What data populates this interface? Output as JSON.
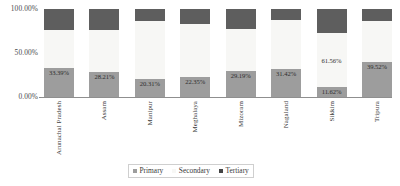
{
  "chart_data": {
    "type": "bar",
    "stacked": true,
    "normalized_percent": true,
    "title": "",
    "subtitle": "",
    "xlabel": "",
    "ylabel": "",
    "ylim": [
      0,
      100
    ],
    "ytick_labels": [
      "0.00%",
      "50.00%",
      "100.00%"
    ],
    "ytick_values": [
      0,
      50,
      100
    ],
    "grid": false,
    "legend_position": "bottom-center",
    "categories": [
      "Arunachal Pradesh",
      "Assam",
      "Manipur",
      "Meghalaya",
      "Mizoram",
      "Nagaland",
      "Sikkim",
      "Tripura"
    ],
    "series": [
      {
        "name": "Primary",
        "color": "#9d9d9d",
        "values": [
          33.39,
          28.21,
          20.31,
          22.35,
          29.19,
          31.42,
          11.62,
          39.52
        ],
        "labels": [
          "33.39%",
          "28.21%",
          "20.31%",
          "22.35%",
          "29.19%",
          "31.42%",
          "11.62%",
          "39.52%"
        ],
        "labels_visible": [
          true,
          true,
          true,
          true,
          true,
          true,
          true,
          true
        ]
      },
      {
        "name": "Secondary",
        "color": "#f7f7f5",
        "values": [
          43.23,
          48.05,
          66.42,
          60.54,
          47.6,
          56.4,
          61.56,
          46.93
        ],
        "labels": [
          "43.23%",
          "48.05%",
          "66.42%",
          "60.54%",
          "47.60%",
          "56.40%",
          "61.56%",
          "46.93%"
        ],
        "labels_visible": [
          false,
          false,
          false,
          false,
          false,
          false,
          true,
          false
        ]
      },
      {
        "name": "Tertiary",
        "color": "#5e5e5e",
        "values": [
          23.38,
          23.74,
          13.27,
          17.11,
          23.21,
          12.18,
          26.82,
          13.55
        ],
        "labels": [
          "23.38%",
          "23.74%",
          "13.27%",
          "17.11%",
          "23.21%",
          "12.18%",
          "26.82%",
          "13.55%"
        ],
        "labels_visible": [
          true,
          true,
          true,
          true,
          true,
          true,
          false,
          true
        ]
      }
    ]
  },
  "axes": {
    "y_ticks": [
      {
        "label": "100.00%"
      },
      {
        "label": "50.00%"
      },
      {
        "label": "0.00%"
      }
    ]
  },
  "legend": {
    "items": [
      {
        "label": "Primary",
        "swatch": "sw-primary"
      },
      {
        "label": "Secondary",
        "swatch": "sw-secondary"
      },
      {
        "label": "Tertiary",
        "swatch": "sw-tertiary"
      }
    ]
  }
}
